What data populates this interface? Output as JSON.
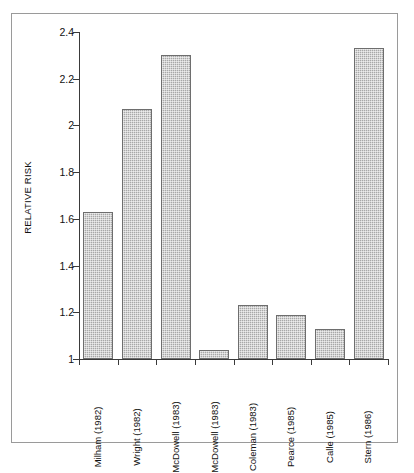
{
  "chart_data": {
    "type": "bar",
    "title": "",
    "xlabel": "",
    "ylabel": "RELATIVE RISK",
    "ylim": [
      1,
      2.4
    ],
    "yticks": [
      "1",
      "1.2",
      "1.4",
      "1.6",
      "1.8",
      "2",
      "2.2",
      "2.4"
    ],
    "ytick_values": [
      1,
      1.2,
      1.4,
      1.6,
      1.8,
      2,
      2.2,
      2.4
    ],
    "grid": false,
    "legend": null,
    "bar_color": "#a8a8a8",
    "bar_border_color": "#6e6e6e",
    "categories": [
      "Milham (1982)",
      "Wright (1982)",
      "McDowell (1983)",
      "McDowell (1983)",
      "Coleman (1983)",
      "Pearce (1985)",
      "Calle (1985)",
      "Stern (1986)"
    ],
    "values": [
      1.63,
      2.07,
      2.3,
      1.04,
      1.23,
      1.19,
      1.13,
      2.33
    ]
  }
}
